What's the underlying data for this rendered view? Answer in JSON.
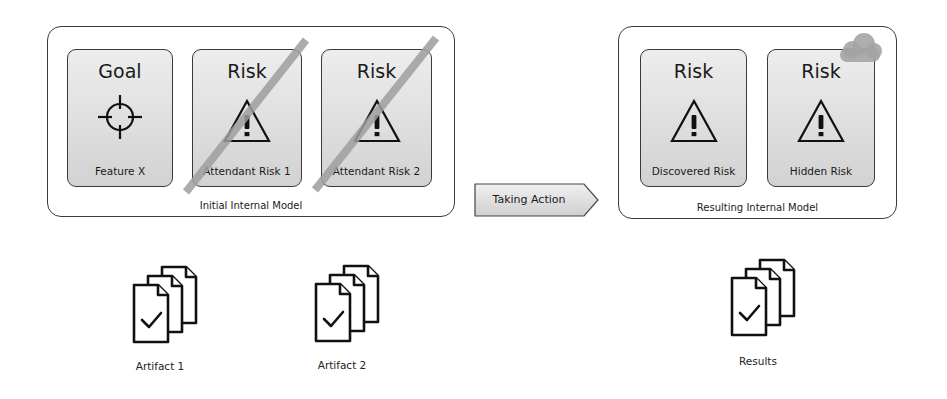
{
  "initial_model": {
    "caption": "Initial Internal Model",
    "cards": [
      {
        "title": "Goal",
        "icon": "crosshair-icon",
        "label": "Feature X",
        "struck": false
      },
      {
        "title": "Risk",
        "icon": "warning-icon",
        "label": "Attendant Risk 1",
        "struck": true
      },
      {
        "title": "Risk",
        "icon": "warning-icon",
        "label": "Attendant Risk 2",
        "struck": true
      }
    ]
  },
  "action": {
    "label": "Taking Action"
  },
  "resulting_model": {
    "caption": "Resulting Internal Model",
    "cards": [
      {
        "title": "Risk",
        "icon": "warning-icon",
        "label": "Discovered Risk",
        "struck": false
      },
      {
        "title": "Risk",
        "icon": "warning-icon",
        "label": "Hidden Risk",
        "struck": false,
        "overlay": "cloud-icon"
      }
    ]
  },
  "artifacts": [
    {
      "label": "Artifact 1",
      "icon": "documents-check-icon"
    },
    {
      "label": "Artifact 2",
      "icon": "documents-check-icon"
    },
    {
      "label": "Results",
      "icon": "documents-check-icon"
    }
  ],
  "colors": {
    "card_fill_top": "#ededed",
    "card_fill_bottom": "#d2d2d2",
    "border": "#3a3a3a",
    "strike": "#a8a8a8",
    "cloud": "#a9a9a9"
  }
}
